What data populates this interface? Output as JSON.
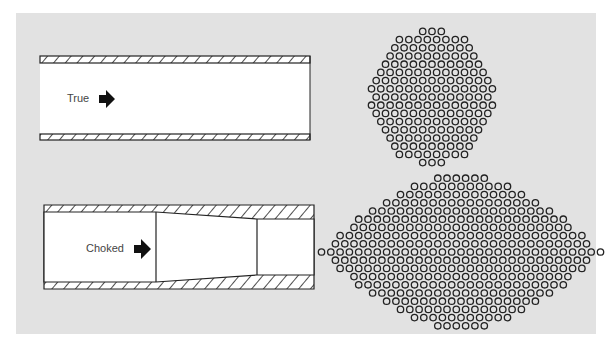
{
  "diagram": {
    "panel_color": "#e2e2e2",
    "line_color": "#222222",
    "pipes": [
      {
        "id": "true",
        "label": "True",
        "type": "straight"
      },
      {
        "id": "choked",
        "label": "Choked",
        "type": "constricted"
      }
    ],
    "clusters": [
      {
        "id": "true-cluster",
        "shape": "round",
        "description": "hexagonally packed circles, roughly round cluster"
      },
      {
        "id": "choked-cluster",
        "shape": "lens",
        "description": "hexagonally packed circles, wide lens/diamond cluster"
      }
    ],
    "arrow_icon": "right-arrow-icon"
  }
}
